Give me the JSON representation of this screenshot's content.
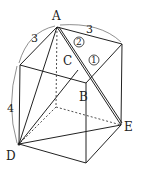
{
  "diagram": {
    "type": "cuboid-geometry",
    "points": {
      "A": "A",
      "B": "B",
      "C": "C",
      "D": "D",
      "E": "E"
    },
    "dimensions": {
      "top_left_edge": "3",
      "top_right_edge": "3",
      "height_edge": "4"
    },
    "circled_labels": {
      "one": "1",
      "two": "2"
    },
    "colors": {
      "line": "#222222",
      "background": "#ffffff"
    }
  }
}
